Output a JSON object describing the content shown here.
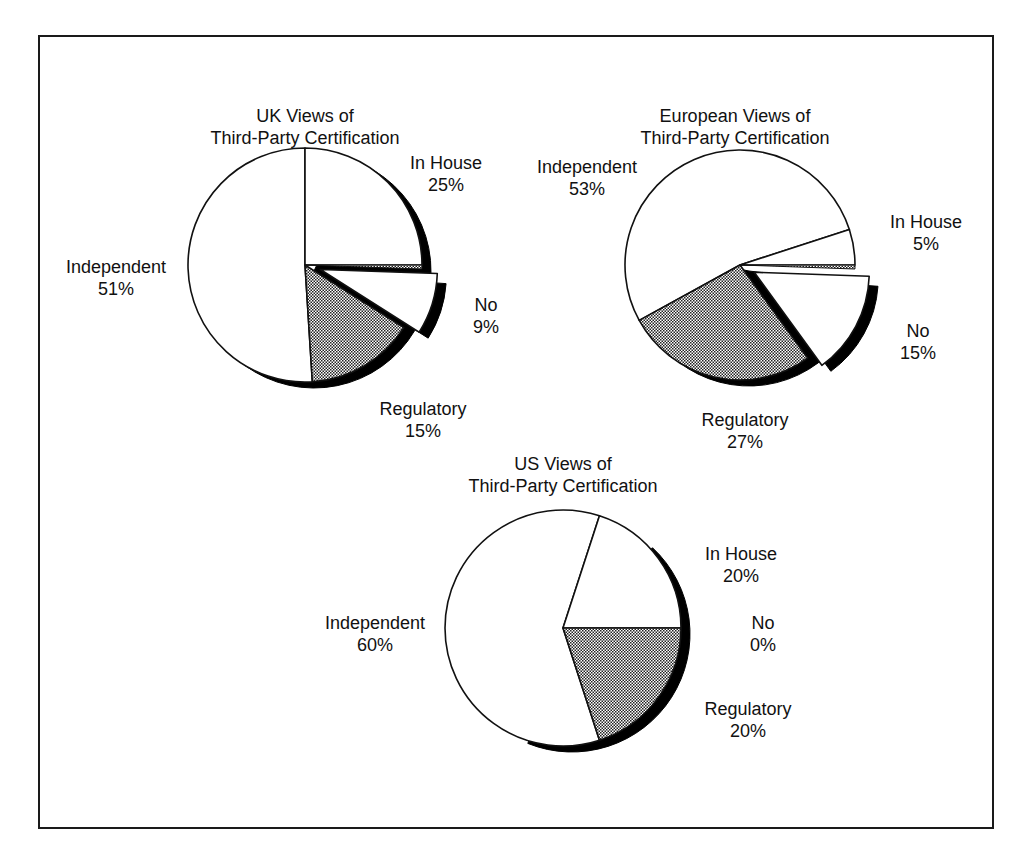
{
  "chart_data": [
    {
      "type": "pie",
      "title": "UK Views of Third-Party Certification",
      "title_lines": [
        "UK Views of",
        "Third-Party Certification"
      ],
      "categories": [
        "In House",
        "Independent",
        "Regulatory",
        "No"
      ],
      "values": [
        25,
        51,
        15,
        9
      ],
      "labels": [
        {
          "name": "In House",
          "pct": "25%"
        },
        {
          "name": "Independent",
          "pct": "51%"
        },
        {
          "name": "Regulatory",
          "pct": "15%"
        },
        {
          "name": "No",
          "pct": "9%"
        }
      ],
      "exploded": [
        "No"
      ],
      "style": "3D-shadow pie, Regulatory hatched"
    },
    {
      "type": "pie",
      "title": "European Views of Third-Party Certification",
      "title_lines": [
        "European Views of",
        "Third-Party Certification"
      ],
      "categories": [
        "In House",
        "Independent",
        "Regulatory",
        "No"
      ],
      "values": [
        5,
        53,
        27,
        15
      ],
      "labels": [
        {
          "name": "In House",
          "pct": "5%"
        },
        {
          "name": "Independent",
          "pct": "53%"
        },
        {
          "name": "Regulatory",
          "pct": "27%"
        },
        {
          "name": "No",
          "pct": "15%"
        }
      ],
      "exploded": [
        "No"
      ],
      "style": "3D-shadow pie, Regulatory hatched"
    },
    {
      "type": "pie",
      "title": "US Views of Third-Party Certification",
      "title_lines": [
        "US Views of",
        "Third-Party Certification"
      ],
      "categories": [
        "In House",
        "Independent",
        "Regulatory",
        "No"
      ],
      "values": [
        20,
        60,
        20,
        0
      ],
      "labels": [
        {
          "name": "In House",
          "pct": "20%"
        },
        {
          "name": "Independent",
          "pct": "60%"
        },
        {
          "name": "Regulatory",
          "pct": "20%"
        },
        {
          "name": "No",
          "pct": "0%"
        }
      ],
      "exploded": [],
      "style": "3D-shadow pie, Regulatory hatched"
    }
  ],
  "colors": {
    "slice_fill": "#ffffff",
    "outline": "#111111",
    "shadow": "#000000",
    "hatch": "#555555"
  }
}
